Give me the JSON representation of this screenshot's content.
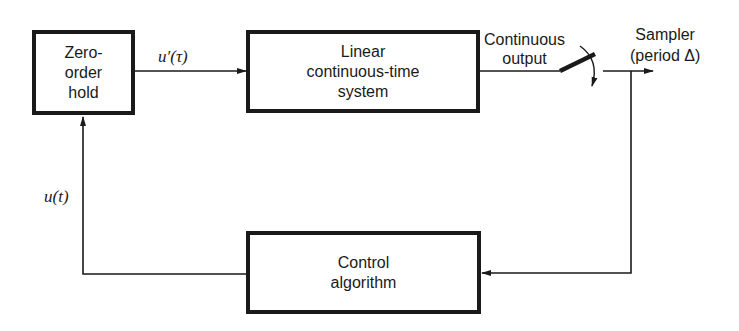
{
  "diagram": {
    "type": "block-diagram",
    "blocks": [
      {
        "id": "zoh",
        "label": "Zero-\norder\nhold"
      },
      {
        "id": "plant",
        "label": "Linear\ncontinuous-time\nsystem"
      },
      {
        "id": "controller",
        "label": "Control\nalgorithm"
      }
    ],
    "labels": {
      "u_prime": "u′(τ)",
      "u_t": "u(t)",
      "continuous_output": "Continuous\noutput",
      "sampler": "Sampler\n(period Δ)"
    },
    "edges": [
      {
        "from": "zoh",
        "to": "plant",
        "label": "u′(τ)"
      },
      {
        "from": "plant",
        "to": "sampler",
        "label": "Continuous output"
      },
      {
        "from": "sampler",
        "to": "controller"
      },
      {
        "from": "controller",
        "to": "zoh",
        "label": "u(t)"
      }
    ],
    "colors": {
      "line": "#1a1a1a",
      "background": "#ffffff"
    }
  }
}
